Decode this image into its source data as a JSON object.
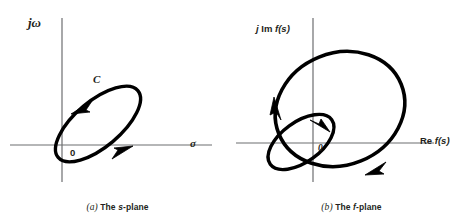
{
  "figure": {
    "background_color": "#ffffff",
    "curve_color": "#000000",
    "axis_color": "#6d6e71",
    "text_color": "#231f20"
  },
  "panel_s": {
    "caption_index": "(a)",
    "caption_the": "The",
    "caption_plane_symbol": "s",
    "caption_plane_word": "-plane",
    "caption_full": "(a) The s-plane",
    "vertical_axis_label": "jω",
    "horizontal_axis_label": "σ",
    "origin_label": "0",
    "contour_label": "C",
    "contour": {
      "shape": "ellipse",
      "center_x": 98,
      "center_y": 124,
      "radius_major": 52,
      "radius_minor": 23,
      "rotation_deg": -40,
      "direction": "counterclockwise",
      "arrow_count": 2
    },
    "axes": {
      "vertical_x": 62,
      "vertical_y_top": 18,
      "vertical_y_bottom": 182,
      "horizontal_y": 145,
      "horizontal_x_left": 10,
      "horizontal_x_right": 212
    }
  },
  "panel_f": {
    "caption_index": "(b)",
    "caption_the": "The",
    "caption_plane_symbol": "f",
    "caption_plane_word": "-plane",
    "caption_full": "(b) The f-plane",
    "vertical_axis_label_j": "j",
    "vertical_axis_label_im": "Im",
    "vertical_axis_label_f": "f(s)",
    "vertical_axis_label": "j Im f(s)",
    "horizontal_axis_label_re": "Re",
    "horizontal_axis_label_f": "f(s)",
    "horizontal_axis_label": "Re f(s)",
    "origin_label": "0",
    "large_loop": {
      "shape": "ellipse",
      "center_x": 106,
      "center_y": 109,
      "radius_major": 66,
      "radius_minor": 56,
      "rotation_deg": -22,
      "direction": "counterclockwise",
      "arrow_count": 2
    },
    "small_loop": {
      "shape": "ellipse",
      "center_x": 67,
      "center_y": 142,
      "radius_major": 38,
      "radius_minor": 20,
      "rotation_deg": -36,
      "direction": "clockwise",
      "arrow_count": 1
    },
    "axes": {
      "vertical_x": 79,
      "vertical_y_top": 18,
      "vertical_y_bottom": 182,
      "horizontal_y": 143,
      "horizontal_x_left": 2,
      "horizontal_x_right": 200
    }
  }
}
